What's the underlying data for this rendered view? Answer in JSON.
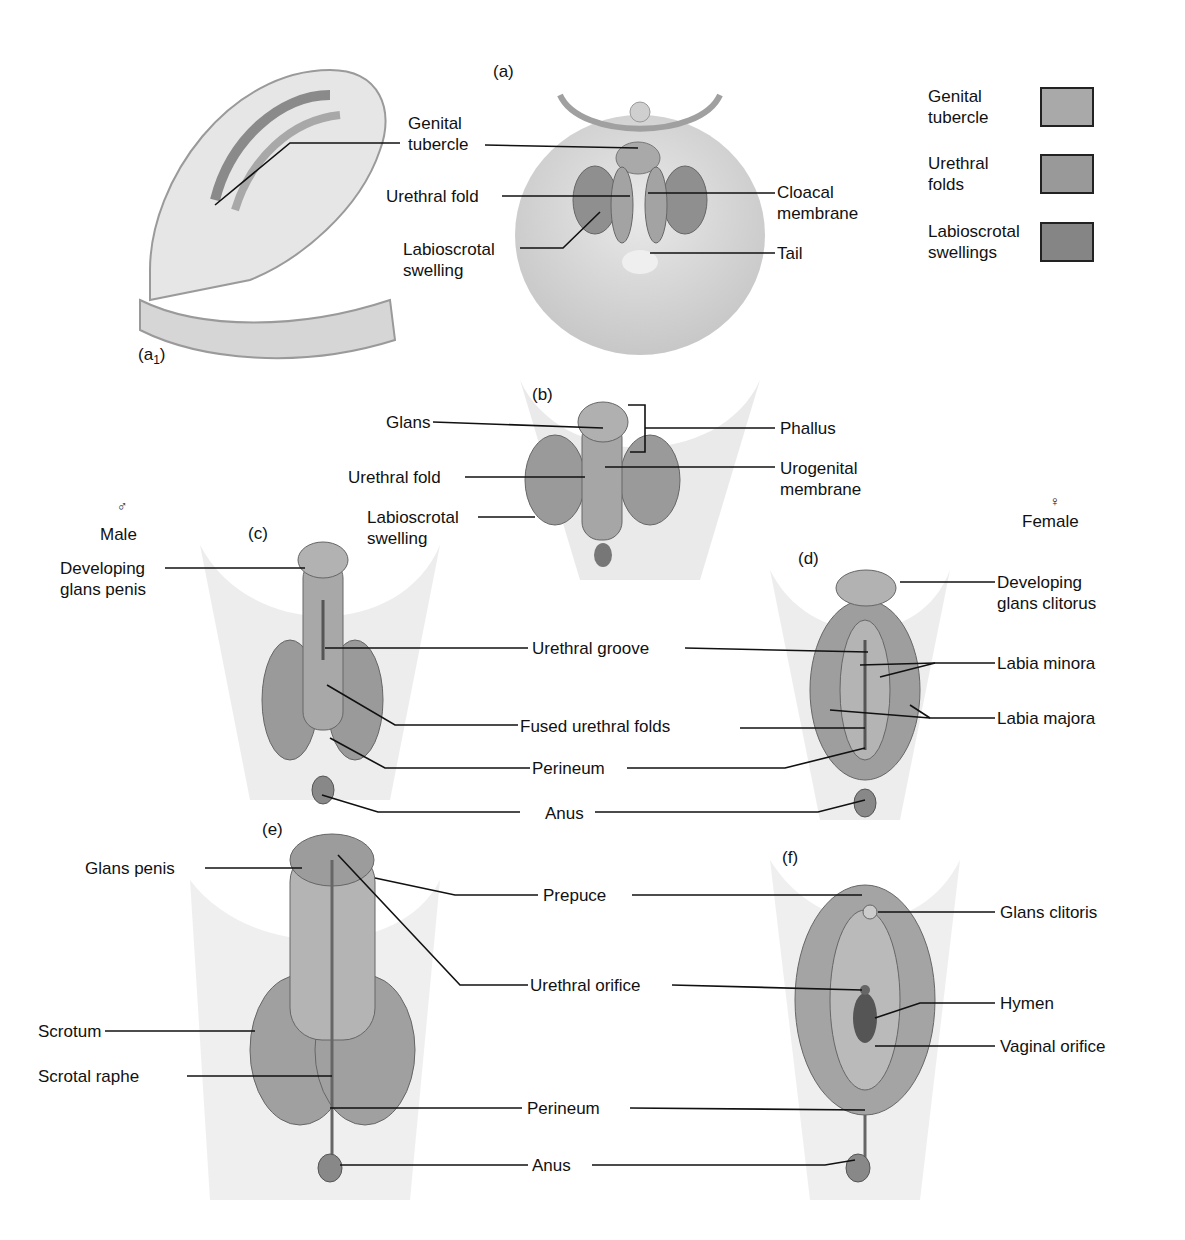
{
  "figure": {
    "panels": {
      "a": "(a)",
      "a1": "(a1)",
      "b": "(b)",
      "c": "(c)",
      "d": "(d)",
      "e": "(e)",
      "f": "(f)"
    },
    "sex_labels": {
      "male_symbol": "♂",
      "male": "Male",
      "female_symbol": "♀",
      "female": "Female"
    }
  },
  "legend": [
    {
      "line1": "Genital",
      "line2": "tubercle",
      "color": "#a9a9a9"
    },
    {
      "line1": "Urethral",
      "line2": "folds",
      "color": "#999999"
    },
    {
      "line1": "Labioscrotal",
      "line2": "swellings",
      "color": "#858585"
    }
  ],
  "labels_a": {
    "genital_tubercle_1": "Genital",
    "genital_tubercle_2": "tubercle",
    "urethral_fold": "Urethral fold",
    "labioscrotal_1": "Labioscrotal",
    "labioscrotal_2": "swelling",
    "cloacal_1": "Cloacal",
    "cloacal_2": "membrane",
    "tail": "Tail"
  },
  "labels_b": {
    "glans": "Glans",
    "phallus": "Phallus",
    "urethral_fold": "Urethral fold",
    "urogenital_1": "Urogenital",
    "urogenital_2": "membrane",
    "labioscrotal_1": "Labioscrotal",
    "labioscrotal_2": "swelling"
  },
  "labels_cd": {
    "dev_glans_penis_1": "Developing",
    "dev_glans_penis_2": "glans penis",
    "dev_glans_clit_1": "Developing",
    "dev_glans_clit_2": "glans clitorus",
    "urethral_groove": "Urethral groove",
    "labia_minora": "Labia minora",
    "fused_urethral_folds": "Fused urethral folds",
    "labia_majora": "Labia majora",
    "perineum": "Perineum",
    "anus": "Anus"
  },
  "labels_ef": {
    "glans_penis": "Glans penis",
    "prepuce": "Prepuce",
    "glans_clitoris": "Glans clitoris",
    "urethral_orifice": "Urethral orifice",
    "hymen": "Hymen",
    "scrotum": "Scrotum",
    "vaginal_orifice": "Vaginal orifice",
    "scrotal_raphe": "Scrotal raphe",
    "perineum": "Perineum",
    "anus": "Anus"
  }
}
